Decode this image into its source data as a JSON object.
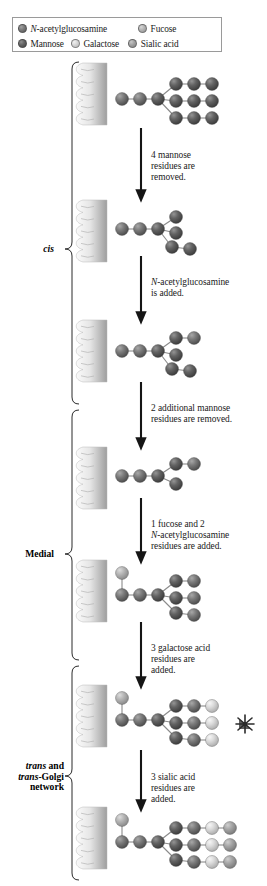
{
  "legend": {
    "entries": [
      {
        "name": "N-acetylglucosamine",
        "italic_prefix": "N",
        "rest": "-acetylglucosamine",
        "color": "#6e6e6e"
      },
      {
        "name": "Fucose",
        "italic_prefix": "",
        "rest": "Fucose",
        "color": "#a8a8a8"
      },
      {
        "name": "Mannose",
        "italic_prefix": "",
        "rest": "Mannose",
        "color": "#5a5a5a"
      },
      {
        "name": "Galactose",
        "italic_prefix": "",
        "rest": "Galactose",
        "color": "#cfcfcf"
      },
      {
        "name": "Sialic acid",
        "italic_prefix": "",
        "rest": "Sialic acid",
        "color": "#9a9a9a"
      }
    ]
  },
  "zones": [
    {
      "id": "cis",
      "lines": [
        "cis"
      ],
      "italic": true
    },
    {
      "id": "medial",
      "lines": [
        "Medial"
      ],
      "italic": false
    },
    {
      "id": "trans",
      "lines": [
        "trans and",
        "trans-Golgi",
        "network"
      ],
      "italic": true
    }
  ],
  "steps": [
    {
      "id": "step-1",
      "lines": [
        "4 mannose",
        "residues are",
        "removed."
      ]
    },
    {
      "id": "step-2",
      "lines": [
        "N-acetylglucosamine",
        "is added."
      ],
      "italic_first_word": "N"
    },
    {
      "id": "step-3",
      "lines": [
        "2 additional mannose",
        "residues are removed."
      ]
    },
    {
      "id": "step-4",
      "lines": [
        "1 fucose and 2",
        "N-acetylglucosamine",
        "residues are added."
      ],
      "italic_second_line": "N"
    },
    {
      "id": "step-5",
      "lines": [
        "3 galactose acid",
        "residues are",
        "added."
      ]
    },
    {
      "id": "step-6",
      "lines": [
        "3 sialic acid",
        "residues are",
        "added."
      ]
    }
  ],
  "colors": {
    "glcnac": "#6e6e6e",
    "mannose": "#5a5a5a",
    "fucose": "#a8a8a8",
    "galactose": "#cfcfcf",
    "sialic": "#9a9a9a",
    "bond": "#8a8a8a",
    "arrow": "#151515",
    "membrane_light": "#f2f2f2",
    "membrane_dark": "#9d9d9d",
    "border": "#9a9a9a"
  },
  "structures": [
    {
      "id": "structure-1",
      "label": "high-mannose precursor",
      "nodes": [
        {
          "id": "g1",
          "type": "glcnac",
          "x": 12,
          "y": 31,
          "r": 6.5
        },
        {
          "id": "g2",
          "type": "glcnac",
          "x": 30,
          "y": 31,
          "r": 6.5
        },
        {
          "id": "m1",
          "type": "mannose",
          "x": 48,
          "y": 31,
          "r": 6.5
        },
        {
          "id": "m2",
          "type": "mannose",
          "x": 66,
          "y": 16,
          "r": 6.5
        },
        {
          "id": "m3",
          "type": "mannose",
          "x": 84,
          "y": 16,
          "r": 6.5
        },
        {
          "id": "m4",
          "type": "mannose",
          "x": 102,
          "y": 16,
          "r": 6.5
        },
        {
          "id": "m5",
          "type": "mannose",
          "x": 66,
          "y": 33,
          "r": 6.5
        },
        {
          "id": "m6",
          "type": "mannose",
          "x": 84,
          "y": 33,
          "r": 6.5
        },
        {
          "id": "m7",
          "type": "mannose",
          "x": 102,
          "y": 33,
          "r": 6.5
        },
        {
          "id": "m8",
          "type": "mannose",
          "x": 66,
          "y": 50,
          "r": 6.5
        },
        {
          "id": "m9",
          "type": "mannose",
          "x": 84,
          "y": 50,
          "r": 6.5
        },
        {
          "id": "m10",
          "type": "mannose",
          "x": 102,
          "y": 50,
          "r": 6.5
        }
      ],
      "bonds": [
        [
          "g1",
          "g2"
        ],
        [
          "g2",
          "m1"
        ],
        [
          "m1",
          "m2"
        ],
        [
          "m2",
          "m3"
        ],
        [
          "m3",
          "m4"
        ],
        [
          "m1",
          "m5"
        ],
        [
          "m5",
          "m6"
        ],
        [
          "m6",
          "m7"
        ],
        [
          "m1",
          "m8"
        ],
        [
          "m8",
          "m9"
        ],
        [
          "m9",
          "m10"
        ]
      ]
    },
    {
      "id": "structure-2",
      "label": "after 4 mannose removed",
      "nodes": [
        {
          "id": "g1",
          "type": "glcnac",
          "x": 12,
          "y": 24,
          "r": 6.5
        },
        {
          "id": "g2",
          "type": "glcnac",
          "x": 30,
          "y": 24,
          "r": 6.5
        },
        {
          "id": "m1",
          "type": "mannose",
          "x": 48,
          "y": 24,
          "r": 6.5
        },
        {
          "id": "m2",
          "type": "mannose",
          "x": 66,
          "y": 12,
          "r": 6.5
        },
        {
          "id": "m3",
          "type": "mannose",
          "x": 66,
          "y": 28,
          "r": 6.5
        },
        {
          "id": "m4",
          "type": "mannose",
          "x": 62,
          "y": 42,
          "r": 6.5
        },
        {
          "id": "m5",
          "type": "mannose",
          "x": 80,
          "y": 44,
          "r": 6.5
        }
      ],
      "bonds": [
        [
          "g1",
          "g2"
        ],
        [
          "g2",
          "m1"
        ],
        [
          "m1",
          "m2"
        ],
        [
          "m1",
          "m3"
        ],
        [
          "m1",
          "m4"
        ],
        [
          "m4",
          "m5"
        ]
      ]
    },
    {
      "id": "structure-3",
      "label": "after GlcNAc added",
      "nodes": [
        {
          "id": "g1",
          "type": "glcnac",
          "x": 12,
          "y": 26,
          "r": 6.5
        },
        {
          "id": "g2",
          "type": "glcnac",
          "x": 30,
          "y": 26,
          "r": 6.5
        },
        {
          "id": "m1",
          "type": "mannose",
          "x": 48,
          "y": 26,
          "r": 6.5
        },
        {
          "id": "m2",
          "type": "mannose",
          "x": 66,
          "y": 13,
          "r": 6.5
        },
        {
          "id": "g3",
          "type": "glcnac",
          "x": 84,
          "y": 13,
          "r": 6.5
        },
        {
          "id": "m3",
          "type": "mannose",
          "x": 66,
          "y": 30,
          "r": 6.5
        },
        {
          "id": "m4",
          "type": "mannose",
          "x": 62,
          "y": 44,
          "r": 6.5
        },
        {
          "id": "m5",
          "type": "mannose",
          "x": 80,
          "y": 46,
          "r": 6.5
        }
      ],
      "bonds": [
        [
          "g1",
          "g2"
        ],
        [
          "g2",
          "m1"
        ],
        [
          "m1",
          "m2"
        ],
        [
          "m2",
          "g3"
        ],
        [
          "m1",
          "m3"
        ],
        [
          "m1",
          "m4"
        ],
        [
          "m4",
          "m5"
        ]
      ]
    },
    {
      "id": "structure-4",
      "label": "after 2 mannose removed",
      "nodes": [
        {
          "id": "g1",
          "type": "glcnac",
          "x": 12,
          "y": 24,
          "r": 6.5
        },
        {
          "id": "g2",
          "type": "glcnac",
          "x": 30,
          "y": 24,
          "r": 6.5
        },
        {
          "id": "m1",
          "type": "mannose",
          "x": 48,
          "y": 24,
          "r": 6.5
        },
        {
          "id": "m2",
          "type": "mannose",
          "x": 66,
          "y": 12,
          "r": 6.5
        },
        {
          "id": "g3",
          "type": "glcnac",
          "x": 84,
          "y": 12,
          "r": 6.5
        },
        {
          "id": "m3",
          "type": "mannose",
          "x": 66,
          "y": 32,
          "r": 6.5
        }
      ],
      "bonds": [
        [
          "g1",
          "g2"
        ],
        [
          "g2",
          "m1"
        ],
        [
          "m1",
          "m2"
        ],
        [
          "m2",
          "g3"
        ],
        [
          "m1",
          "m3"
        ]
      ]
    },
    {
      "id": "structure-5",
      "label": "after fucose and 2 GlcNAc added",
      "nodes": [
        {
          "id": "f1",
          "type": "fucose",
          "x": 12,
          "y": 8,
          "r": 6.5
        },
        {
          "id": "g1",
          "type": "glcnac",
          "x": 12,
          "y": 30,
          "r": 6.5
        },
        {
          "id": "g2",
          "type": "glcnac",
          "x": 30,
          "y": 30,
          "r": 6.5
        },
        {
          "id": "m1",
          "type": "mannose",
          "x": 48,
          "y": 30,
          "r": 6.5
        },
        {
          "id": "m2",
          "type": "mannose",
          "x": 66,
          "y": 16,
          "r": 6.5
        },
        {
          "id": "g3",
          "type": "glcnac",
          "x": 84,
          "y": 16,
          "r": 6.5
        },
        {
          "id": "m3",
          "type": "mannose",
          "x": 66,
          "y": 33,
          "r": 6.5
        },
        {
          "id": "g4",
          "type": "glcnac",
          "x": 84,
          "y": 33,
          "r": 6.5
        },
        {
          "id": "m4",
          "type": "mannose",
          "x": 66,
          "y": 48,
          "r": 6.5
        },
        {
          "id": "g5",
          "type": "glcnac",
          "x": 84,
          "y": 50,
          "r": 6.5
        }
      ],
      "bonds": [
        [
          "f1",
          "g1"
        ],
        [
          "g1",
          "g2"
        ],
        [
          "g2",
          "m1"
        ],
        [
          "m1",
          "m2"
        ],
        [
          "m2",
          "g3"
        ],
        [
          "m1",
          "m3"
        ],
        [
          "m3",
          "g4"
        ],
        [
          "m1",
          "m4"
        ],
        [
          "m4",
          "g5"
        ]
      ]
    },
    {
      "id": "structure-6",
      "label": "after 3 galactose added",
      "nodes": [
        {
          "id": "f1",
          "type": "fucose",
          "x": 12,
          "y": 8,
          "r": 6.5
        },
        {
          "id": "g1",
          "type": "glcnac",
          "x": 12,
          "y": 30,
          "r": 6.5
        },
        {
          "id": "g2",
          "type": "glcnac",
          "x": 30,
          "y": 30,
          "r": 6.5
        },
        {
          "id": "m1",
          "type": "mannose",
          "x": 48,
          "y": 30,
          "r": 6.5
        },
        {
          "id": "m2",
          "type": "mannose",
          "x": 66,
          "y": 16,
          "r": 6.5
        },
        {
          "id": "g3",
          "type": "glcnac",
          "x": 84,
          "y": 16,
          "r": 6.5
        },
        {
          "id": "ga1",
          "type": "galactose",
          "x": 102,
          "y": 16,
          "r": 6.5
        },
        {
          "id": "m3",
          "type": "mannose",
          "x": 66,
          "y": 33,
          "r": 6.5
        },
        {
          "id": "g4",
          "type": "glcnac",
          "x": 84,
          "y": 33,
          "r": 6.5
        },
        {
          "id": "ga2",
          "type": "galactose",
          "x": 102,
          "y": 33,
          "r": 6.5
        },
        {
          "id": "m4",
          "type": "mannose",
          "x": 66,
          "y": 48,
          "r": 6.5
        },
        {
          "id": "g5",
          "type": "glcnac",
          "x": 84,
          "y": 50,
          "r": 6.5
        },
        {
          "id": "ga3",
          "type": "galactose",
          "x": 102,
          "y": 50,
          "r": 6.5
        }
      ],
      "bonds": [
        [
          "f1",
          "g1"
        ],
        [
          "g1",
          "g2"
        ],
        [
          "g2",
          "m1"
        ],
        [
          "m1",
          "m2"
        ],
        [
          "m2",
          "g3"
        ],
        [
          "g3",
          "ga1"
        ],
        [
          "m1",
          "m3"
        ],
        [
          "m3",
          "g4"
        ],
        [
          "g4",
          "ga2"
        ],
        [
          "m1",
          "m4"
        ],
        [
          "m4",
          "g5"
        ],
        [
          "g5",
          "ga3"
        ]
      ]
    },
    {
      "id": "structure-7",
      "label": "after 3 sialic acid added",
      "nodes": [
        {
          "id": "f1",
          "type": "fucose",
          "x": 12,
          "y": 8,
          "r": 6.5
        },
        {
          "id": "g1",
          "type": "glcnac",
          "x": 12,
          "y": 30,
          "r": 6.5
        },
        {
          "id": "g2",
          "type": "glcnac",
          "x": 30,
          "y": 30,
          "r": 6.5
        },
        {
          "id": "m1",
          "type": "mannose",
          "x": 48,
          "y": 30,
          "r": 6.5
        },
        {
          "id": "m2",
          "type": "mannose",
          "x": 66,
          "y": 16,
          "r": 6.5
        },
        {
          "id": "g3",
          "type": "glcnac",
          "x": 84,
          "y": 16,
          "r": 6.5
        },
        {
          "id": "ga1",
          "type": "galactose",
          "x": 102,
          "y": 16,
          "r": 6.5
        },
        {
          "id": "s1",
          "type": "sialic",
          "x": 120,
          "y": 16,
          "r": 6.5
        },
        {
          "id": "m3",
          "type": "mannose",
          "x": 66,
          "y": 33,
          "r": 6.5
        },
        {
          "id": "g4",
          "type": "glcnac",
          "x": 84,
          "y": 33,
          "r": 6.5
        },
        {
          "id": "ga2",
          "type": "galactose",
          "x": 102,
          "y": 33,
          "r": 6.5
        },
        {
          "id": "s2",
          "type": "sialic",
          "x": 120,
          "y": 33,
          "r": 6.5
        },
        {
          "id": "m4",
          "type": "mannose",
          "x": 66,
          "y": 48,
          "r": 6.5
        },
        {
          "id": "g5",
          "type": "glcnac",
          "x": 84,
          "y": 50,
          "r": 6.5
        },
        {
          "id": "ga3",
          "type": "galactose",
          "x": 102,
          "y": 50,
          "r": 6.5
        },
        {
          "id": "s3",
          "type": "sialic",
          "x": 120,
          "y": 50,
          "r": 6.5
        }
      ],
      "bonds": [
        [
          "f1",
          "g1"
        ],
        [
          "g1",
          "g2"
        ],
        [
          "g2",
          "m1"
        ],
        [
          "m1",
          "m2"
        ],
        [
          "m2",
          "g3"
        ],
        [
          "g3",
          "ga1"
        ],
        [
          "ga1",
          "s1"
        ],
        [
          "m1",
          "m3"
        ],
        [
          "m3",
          "g4"
        ],
        [
          "g4",
          "ga2"
        ],
        [
          "ga2",
          "s2"
        ],
        [
          "m1",
          "m4"
        ],
        [
          "m4",
          "g5"
        ],
        [
          "g5",
          "ga3"
        ],
        [
          "ga3",
          "s3"
        ]
      ]
    }
  ]
}
